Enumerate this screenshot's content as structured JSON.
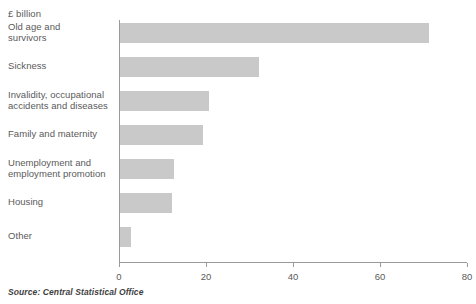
{
  "unit_caption": "£ billion",
  "source_note": "Source: Central Statistical Office",
  "colors": {
    "bar_fill": "#c9c9c9",
    "axis": "#9a9a9a",
    "text": "#5a5a5a",
    "background": "#ffffff"
  },
  "chart_data": {
    "type": "bar",
    "orientation": "horizontal",
    "title": "",
    "subtitle": "",
    "xlabel": "£ billion",
    "ylabel": "",
    "xlim": [
      0,
      80
    ],
    "xticks": [
      0,
      20,
      40,
      60,
      80
    ],
    "xtick_labels": [
      "0",
      "20",
      "40",
      "60",
      "80"
    ],
    "grid": false,
    "legend": false,
    "categories": [
      "Old age and survivors",
      "Sickness",
      "Invalidity, occupational accidents and diseases",
      "Family and maternity",
      "Unemployment and employment promotion",
      "Housing",
      "Other"
    ],
    "category_lines": [
      [
        "Old age and",
        "survivors"
      ],
      [
        "Sickness"
      ],
      [
        "Invalidity, occupational",
        "accidents and diseases"
      ],
      [
        "Family and maternity"
      ],
      [
        "Unemployment and",
        "employment promotion"
      ],
      [
        "Housing"
      ],
      [
        "Other"
      ]
    ],
    "values": [
      71,
      32,
      20.5,
      19,
      12.3,
      12,
      2.5
    ],
    "series": [
      {
        "name": "Social protection expenditure",
        "values": [
          71,
          32,
          20.5,
          19,
          12.3,
          12,
          2.5
        ]
      }
    ]
  }
}
